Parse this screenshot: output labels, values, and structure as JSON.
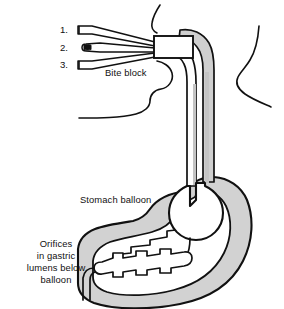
{
  "figure": {
    "background_color": "#ffffff",
    "line_color": "#111111",
    "tissue_fill": "#d2d2d2",
    "lumen_fill": "#ffffff",
    "shade_fill": "#c0c0c0",
    "numbered_lumens": [
      {
        "marker": "1.",
        "name": "lumen-one"
      },
      {
        "marker": "2.",
        "name": "lumen-two"
      },
      {
        "marker": "3.",
        "name": "lumen-three"
      }
    ],
    "labels": {
      "bite_block": "Bite block",
      "stomach_balloon": "Stomach balloon",
      "orifices": [
        "Orifices",
        "in gastric",
        "lumens below",
        "balloon"
      ]
    }
  }
}
